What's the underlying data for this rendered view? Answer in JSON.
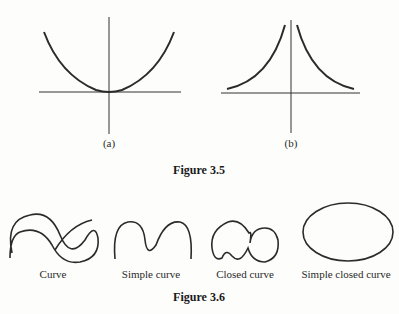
{
  "figure_3_5": {
    "caption": "Figure 3.5",
    "panels": [
      {
        "label": "(a)",
        "description": "Parabola opening upward with vertex at origin"
      },
      {
        "label": "(b)",
        "description": "Two curves approaching vertical axis asymptotically, decaying toward horizontal axis"
      }
    ]
  },
  "figure_3_6": {
    "caption": "Figure 3.6",
    "items": [
      {
        "label": "Curve"
      },
      {
        "label": "Simple curve"
      },
      {
        "label": "Closed curve"
      },
      {
        "label": "Simple closed curve"
      }
    ]
  },
  "colors": {
    "stroke": "#2b2b2b",
    "background": "#fdfdfb"
  }
}
